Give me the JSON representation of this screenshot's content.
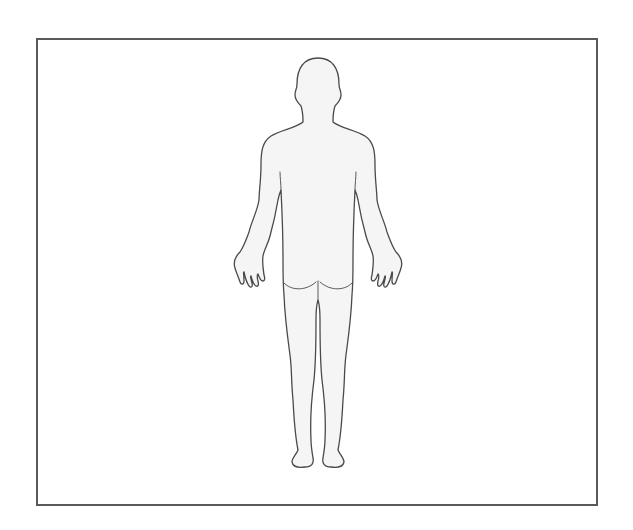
{
  "diagram": {
    "type": "body-outline",
    "view": "posterior",
    "colors": {
      "frame": "#5a5a5a",
      "outline": "#4a4a4a",
      "fill": "#f4f4f4",
      "background": "#ffffff"
    },
    "parts": [
      "head",
      "neck",
      "torso",
      "left-arm",
      "right-arm",
      "left-hand",
      "right-hand",
      "buttocks",
      "left-leg",
      "right-leg",
      "left-foot",
      "right-foot"
    ]
  }
}
